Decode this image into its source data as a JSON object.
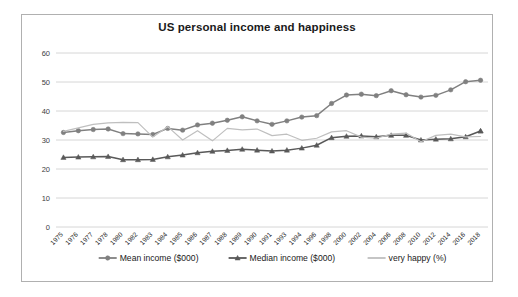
{
  "chart_data": {
    "type": "line",
    "title": "US personal income and happiness",
    "xlabel": "",
    "ylabel": "",
    "ylim": [
      0,
      60
    ],
    "ytick_step": 10,
    "yticks": [
      0,
      10,
      20,
      30,
      40,
      50,
      60
    ],
    "grid": true,
    "legend_position": "bottom",
    "categories": [
      "1975",
      "1976",
      "1977",
      "1978",
      "1980",
      "1982",
      "1983",
      "1984",
      "1985",
      "1986",
      "1987",
      "1988",
      "1989",
      "1990",
      "1991",
      "1993",
      "1994",
      "1996",
      "1998",
      "2000",
      "2002",
      "2004",
      "2006",
      "2008",
      "2010",
      "2012",
      "2014",
      "2016",
      "2018"
    ],
    "series": [
      {
        "name": "Mean income ($000)",
        "color": "#808080",
        "marker": "circle",
        "values": [
          32.6,
          33.2,
          33.6,
          33.8,
          32.2,
          32.1,
          31.9,
          34.0,
          33.4,
          35.2,
          35.8,
          36.8,
          38.0,
          36.6,
          35.4,
          36.6,
          37.9,
          38.4,
          42.6,
          45.5,
          45.8,
          45.3,
          47.0,
          45.6,
          44.8,
          45.4,
          47.3,
          50.1,
          50.6
        ]
      },
      {
        "name": "Median income ($000)",
        "color": "#595959",
        "marker": "triangle",
        "values": [
          24.0,
          24.1,
          24.2,
          24.3,
          23.2,
          23.2,
          23.3,
          24.2,
          24.8,
          25.6,
          26.1,
          26.4,
          26.8,
          26.5,
          26.2,
          26.5,
          27.2,
          28.2,
          30.8,
          31.3,
          31.4,
          31.1,
          31.6,
          31.6,
          30.0,
          30.3,
          30.4,
          31.1,
          33.1
        ]
      },
      {
        "name": "very happy (%)",
        "color": "#bfbfbf",
        "marker": "none",
        "values": [
          33.0,
          34.2,
          35.4,
          35.9,
          36.1,
          36.0,
          31.0,
          34.6,
          30.0,
          33.2,
          29.7,
          34.0,
          33.5,
          33.8,
          31.5,
          32.0,
          29.9,
          30.6,
          32.8,
          33.2,
          31.0,
          30.6,
          32.0,
          32.4,
          29.4,
          31.6,
          32.0,
          31.1,
          31.2
        ]
      }
    ],
    "annotations": [
      {
        "name": "median-income-2018-marker",
        "series": "Median income ($000)",
        "category": "2018",
        "value": 33.1,
        "detached": true
      }
    ]
  }
}
